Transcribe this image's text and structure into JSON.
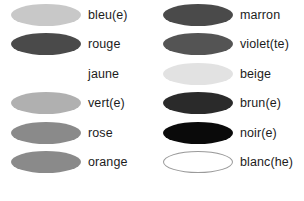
{
  "background_color": "#ffffff",
  "text_color": "#1c1c1c",
  "legend": {
    "columns": [
      {
        "name": "left-column",
        "rows": [
          {
            "label": "bleu(e)",
            "swatch_color": "#c8c8c8",
            "outlined": false,
            "visible": true
          },
          {
            "label": "rouge",
            "swatch_color": "#4a4a4a",
            "outlined": false,
            "visible": true
          },
          {
            "label": "jaune",
            "swatch_color": "#ffffff",
            "outlined": false,
            "visible": false
          },
          {
            "label": "vert(e)",
            "swatch_color": "#b0b0b0",
            "outlined": false,
            "visible": true
          },
          {
            "label": "rose",
            "swatch_color": "#8a8a8a",
            "outlined": false,
            "visible": true
          },
          {
            "label": "orange",
            "swatch_color": "#8a8a8a",
            "outlined": false,
            "visible": true
          }
        ]
      },
      {
        "name": "right-column",
        "rows": [
          {
            "label": "marron",
            "swatch_color": "#4a4a4a",
            "outlined": false,
            "visible": true
          },
          {
            "label": "violet(te)",
            "swatch_color": "#545454",
            "outlined": false,
            "visible": true
          },
          {
            "label": "beige",
            "swatch_color": "#e2e2e2",
            "outlined": false,
            "visible": true
          },
          {
            "label": "brun(e)",
            "swatch_color": "#2a2a2a",
            "outlined": false,
            "visible": true
          },
          {
            "label": "noir(e)",
            "swatch_color": "#0a0a0a",
            "outlined": false,
            "visible": true
          },
          {
            "label": "blanc(he)",
            "swatch_color": "#ffffff",
            "outlined": true,
            "visible": true
          }
        ]
      }
    ]
  }
}
